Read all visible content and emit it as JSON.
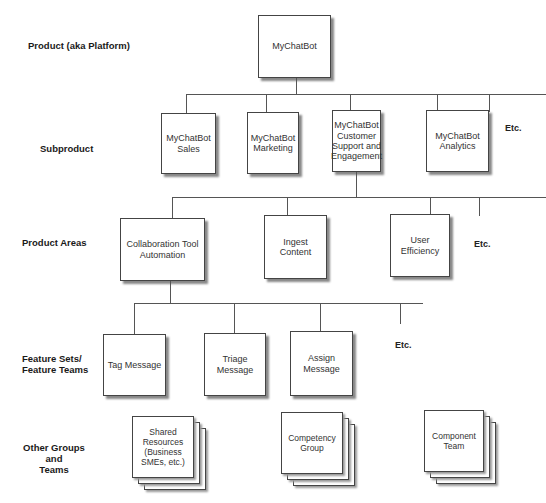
{
  "levels": {
    "product": "Product (aka Platform)",
    "subproduct": "Subproduct",
    "product_areas": "Product Areas",
    "feature_sets_line1": "Feature  Sets/",
    "feature_sets_line2": "Feature Teams",
    "other_groups_line1": "Other Groups and",
    "other_groups_line2": "Teams"
  },
  "product": {
    "name": "MyChatBot"
  },
  "subproducts": [
    {
      "name": "MyChatBot Sales"
    },
    {
      "name": "MyChatBot Marketing"
    },
    {
      "name": "MyChatBot Customer Support and Engagement"
    },
    {
      "name": "MyChatBot Analytics"
    }
  ],
  "product_areas": [
    {
      "name": "Collaboration Tool Automation"
    },
    {
      "name": "Ingest Content"
    },
    {
      "name": "User Efficiency"
    }
  ],
  "feature_sets": [
    {
      "name": "Tag Message"
    },
    {
      "name": "Triage Message"
    },
    {
      "name": "Assign Message"
    }
  ],
  "other_groups": [
    {
      "name": "Shared Resources (Business SMEs, etc.)"
    },
    {
      "name": "Competency Group"
    },
    {
      "name": "Component Team"
    }
  ],
  "etc_label": "Etc."
}
